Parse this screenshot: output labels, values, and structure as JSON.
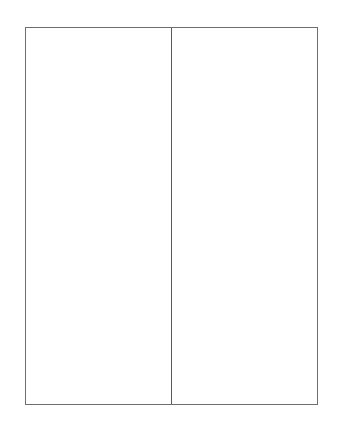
{
  "diagram": {
    "type": "two-column-frame",
    "columns": [
      {
        "id": "left",
        "content": ""
      },
      {
        "id": "right",
        "content": ""
      }
    ],
    "colors": {
      "border": "#6e6e6e",
      "divider": "#5a5a5a",
      "background": "#ffffff"
    }
  }
}
